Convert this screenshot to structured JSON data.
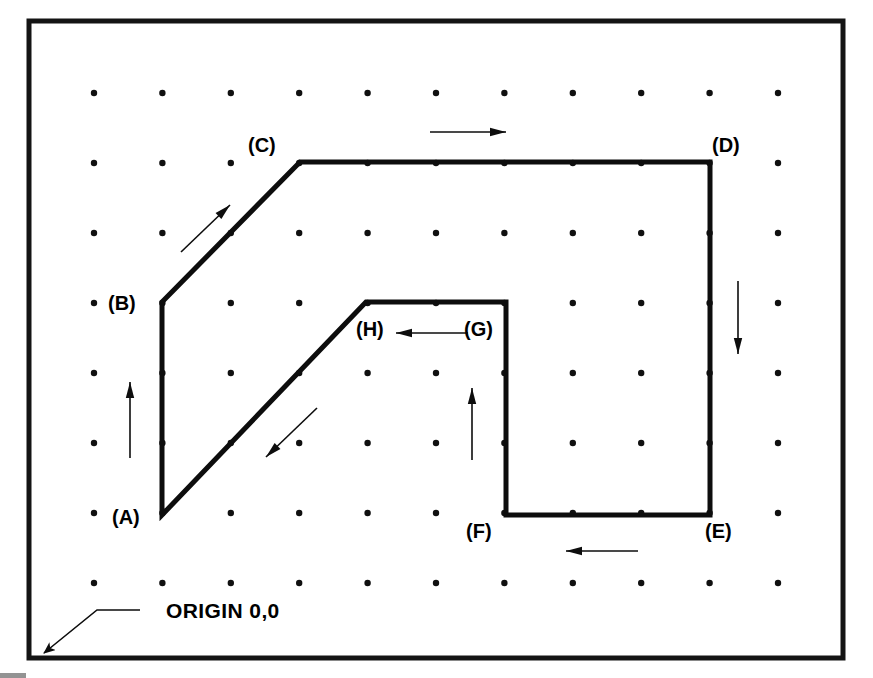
{
  "diagram": {
    "origin_label": "ORIGIN 0,0",
    "frame": {
      "x": 29,
      "y": 21,
      "width": 814,
      "height": 637,
      "stroke": "#141414",
      "stroke_width": 5
    },
    "colors": {
      "line": "#0d0d0d",
      "dot": "#101010",
      "background": "#ffffff",
      "frame": "#141414"
    },
    "grid": {
      "columns": 11,
      "rows": 8,
      "x_start": 94,
      "x_step": 68.4,
      "y_start": 93,
      "y_step": 70,
      "dot_radius": 3.2
    },
    "vertices": [
      {
        "id": "A",
        "label": "(A)",
        "x": 162,
        "y": 515,
        "label_x": 112,
        "label_y": 524,
        "label_anchor": "start"
      },
      {
        "id": "B",
        "label": "(B)",
        "x": 162,
        "y": 302,
        "label_x": 108,
        "label_y": 310,
        "label_anchor": "start"
      },
      {
        "id": "C",
        "label": "(C)",
        "x": 300,
        "y": 162,
        "label_x": 248,
        "label_y": 152,
        "label_anchor": "start"
      },
      {
        "id": "D",
        "label": "(D)",
        "x": 710,
        "y": 162,
        "label_x": 712,
        "label_y": 152,
        "label_anchor": "start"
      },
      {
        "id": "E",
        "label": "(E)",
        "x": 710,
        "y": 515,
        "label_x": 705,
        "label_y": 538,
        "label_anchor": "start"
      },
      {
        "id": "F",
        "label": "(F)",
        "x": 506,
        "y": 515,
        "label_x": 466,
        "label_y": 538,
        "label_anchor": "start"
      },
      {
        "id": "G",
        "label": "(G)",
        "x": 506,
        "y": 302,
        "label_x": 464,
        "label_y": 336,
        "label_anchor": "start"
      },
      {
        "id": "H",
        "label": "(H)",
        "x": 366,
        "y": 302,
        "label_x": 356,
        "label_y": 336,
        "label_anchor": "start"
      }
    ],
    "outline_order": [
      "A",
      "B",
      "C",
      "D",
      "E",
      "F",
      "G",
      "H"
    ],
    "outline_closed": true,
    "segments": [
      {
        "from": "A",
        "to": "B",
        "direction": "up"
      },
      {
        "from": "B",
        "to": "C",
        "direction": "up-right"
      },
      {
        "from": "C",
        "to": "D",
        "direction": "right"
      },
      {
        "from": "D",
        "to": "E",
        "direction": "down"
      },
      {
        "from": "E",
        "to": "F",
        "direction": "left"
      },
      {
        "from": "F",
        "to": "G",
        "direction": "up"
      },
      {
        "from": "G",
        "to": "H",
        "direction": "left"
      },
      {
        "from": "H",
        "to": "A",
        "direction": "down-left"
      }
    ],
    "direction_arrows": [
      {
        "for_segment": "A-B",
        "direction": "up",
        "tail_x": 130,
        "tail_y": 458,
        "head_x": 130,
        "head_y": 382
      },
      {
        "for_segment": "B-C",
        "direction": "up-right",
        "tail_x": 181,
        "tail_y": 252,
        "head_x": 230,
        "head_y": 205
      },
      {
        "for_segment": "C-D",
        "direction": "right",
        "tail_x": 430,
        "tail_y": 132,
        "head_x": 506,
        "head_y": 132
      },
      {
        "for_segment": "D-E",
        "direction": "down",
        "tail_x": 738,
        "tail_y": 281,
        "head_x": 738,
        "head_y": 354
      },
      {
        "for_segment": "E-F",
        "direction": "left",
        "tail_x": 638,
        "tail_y": 551,
        "head_x": 566,
        "head_y": 551
      },
      {
        "for_segment": "F-G",
        "direction": "up",
        "tail_x": 472,
        "tail_y": 460,
        "head_x": 472,
        "head_y": 388
      },
      {
        "for_segment": "G-H",
        "direction": "left",
        "tail_x": 468,
        "tail_y": 333,
        "head_x": 396,
        "head_y": 333
      },
      {
        "for_segment": "H-A",
        "direction": "down-left",
        "tail_x": 317,
        "tail_y": 408,
        "head_x": 266,
        "head_y": 457
      }
    ],
    "origin_callout": {
      "text": "ORIGIN 0,0",
      "text_x": 166,
      "text_y": 618,
      "leader_points": "140,610 97,610 44,653",
      "arrow_head_x": 36,
      "arrow_head_y": 660,
      "arrow_angle_deg": 140
    }
  }
}
